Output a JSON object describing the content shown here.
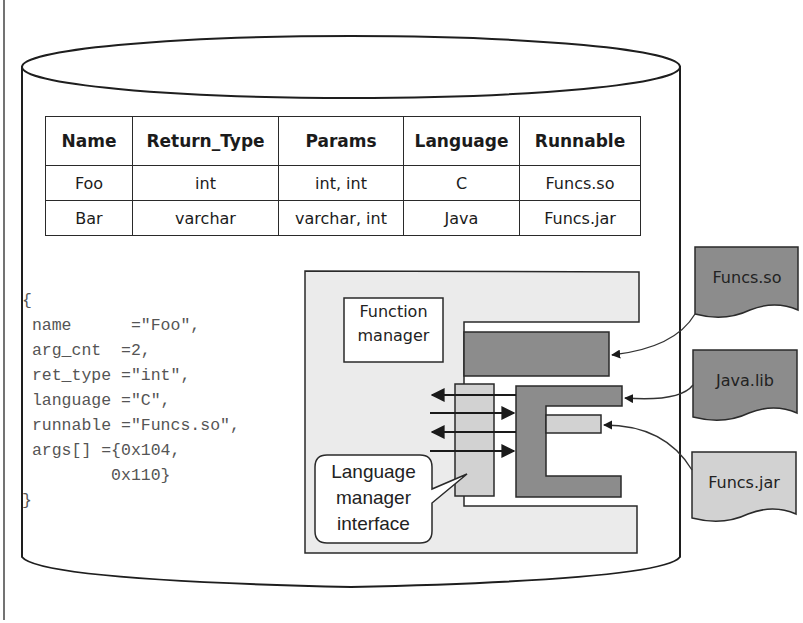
{
  "diagram": {
    "type": "database-function-catalog",
    "table": {
      "columns": [
        "Name",
        "Return_Type",
        "Params",
        "Language",
        "Runnable"
      ],
      "rows": [
        [
          "Foo",
          "int",
          "int, int",
          "C",
          "Funcs.so"
        ],
        [
          "Bar",
          "varchar",
          "varchar, int",
          "Java",
          "Funcs.jar"
        ]
      ]
    },
    "code_lines": [
      "{",
      " name      =\"Foo\",",
      " arg_cnt  =2,",
      " ret_type =\"int\",",
      " language =\"C\",",
      " runnable =\"Funcs.so\",",
      " args[] ={0x104,",
      "         0x110}",
      "}"
    ],
    "function_manager_label": "Function manager",
    "language_manager_label": "Language manager interface",
    "files": [
      {
        "name": "Funcs.so",
        "shade": "dark"
      },
      {
        "name": "Java.lib",
        "shade": "dark"
      },
      {
        "name": "Funcs.jar",
        "shade": "light"
      }
    ],
    "colors": {
      "dark_component": "#8c8c8c",
      "light_component": "#d2d2d2",
      "panel": "#ebebeb",
      "stroke": "#2a2a2a"
    }
  }
}
